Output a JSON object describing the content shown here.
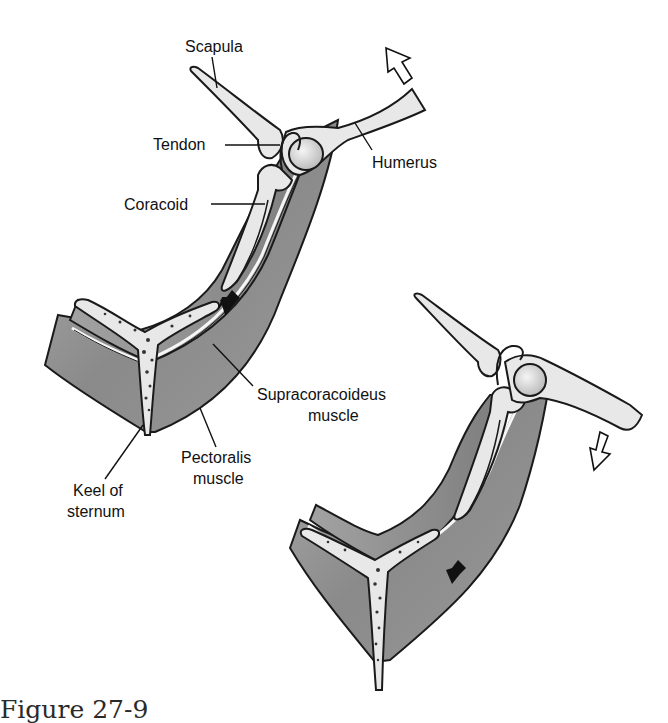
{
  "figure": {
    "caption": "Figure 27-9",
    "labels": {
      "scapula": "Scapula",
      "tendon": "Tendon",
      "humerus": "Humerus",
      "coracoid": "Coracoid",
      "supracoracoideus_line1": "Supracoracoideus",
      "supracoracoideus_line2": "muscle",
      "pectoralis_line1": "Pectoralis",
      "pectoralis_line2": "muscle",
      "keel_line1": "Keel of",
      "keel_line2": "sternum"
    },
    "panels": [
      {
        "name": "upstroke",
        "wing_arrow": "up-left hollow arrow",
        "muscle_arrow": "down-left solid arrow"
      },
      {
        "name": "downstroke",
        "wing_arrow": "down-left hollow arrow",
        "muscle_arrow": "down-left solid arrow"
      }
    ],
    "colors": {
      "background": "#ffffff",
      "bone": "#e8e8e8",
      "muscle": "#8a8a8a",
      "outline": "#1a1a1a"
    }
  }
}
